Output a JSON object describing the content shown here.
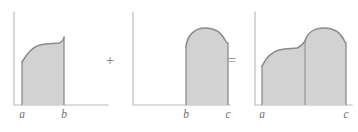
{
  "figure": {
    "background_color": "#ffffff",
    "fill_color": "#d2d2d2",
    "curve_color": "#8c8c8c",
    "axis_color": "#b9b9b9",
    "label_color": "#6f6f6f",
    "operators": [
      {
        "name": "plus",
        "symbol": "+",
        "x": 110,
        "y": 62
      },
      {
        "name": "equals",
        "symbol": "=",
        "x": 232,
        "y": 62
      }
    ],
    "panels": [
      {
        "id": "panel-left",
        "name": "integral-from-a-to-b",
        "axis": {
          "x": 14,
          "y_top": 12,
          "baseline": 105,
          "x_end": 108
        },
        "labels": [
          {
            "text": "a",
            "x": 22,
            "y": 118
          },
          {
            "text": "b",
            "x": 64,
            "y": 118
          }
        ],
        "region": {
          "x_start": 22,
          "x_end": 64,
          "top_path": "M 22,62 C 27,54 32,47 40,45 C 48,43 55,44 59,43 C 62,42 64,39 64,37"
        },
        "dividers": []
      },
      {
        "id": "panel-middle",
        "name": "integral-from-b-to-c",
        "axis": {
          "x": 133,
          "y_top": 12,
          "baseline": 105,
          "x_end": 230
        },
        "labels": [
          {
            "text": "b",
            "x": 186,
            "y": 118
          },
          {
            "text": "c",
            "x": 228,
            "y": 118
          }
        ],
        "region": {
          "x_start": 186,
          "x_end": 228,
          "top_path": "M 186,47 C 187,36 194,28 205,28 C 216,28 222,34 225,40 C 226,42 227,43 228,43"
        },
        "dividers": []
      },
      {
        "id": "panel-right",
        "name": "integral-from-a-to-c",
        "axis": {
          "x": 255,
          "y_top": 12,
          "baseline": 105,
          "x_end": 352
        },
        "labels": [
          {
            "text": "a",
            "x": 262,
            "y": 118
          },
          {
            "text": "c",
            "x": 346,
            "y": 118
          }
        ],
        "region": {
          "x_start": 262,
          "x_end": 346,
          "top_path": "M 262,66 C 266,58 271,52 279,50 C 287,48 293,49 297,48 C 300,47 303,44 305,41 C 307,34 313,28 324,28 C 335,28 341,34 344,40 C 345,42 345,43 346,43"
        },
        "dividers": [
          {
            "name": "b-divider",
            "x": 305,
            "y_top": 41,
            "y_bottom": 105
          }
        ]
      }
    ]
  }
}
